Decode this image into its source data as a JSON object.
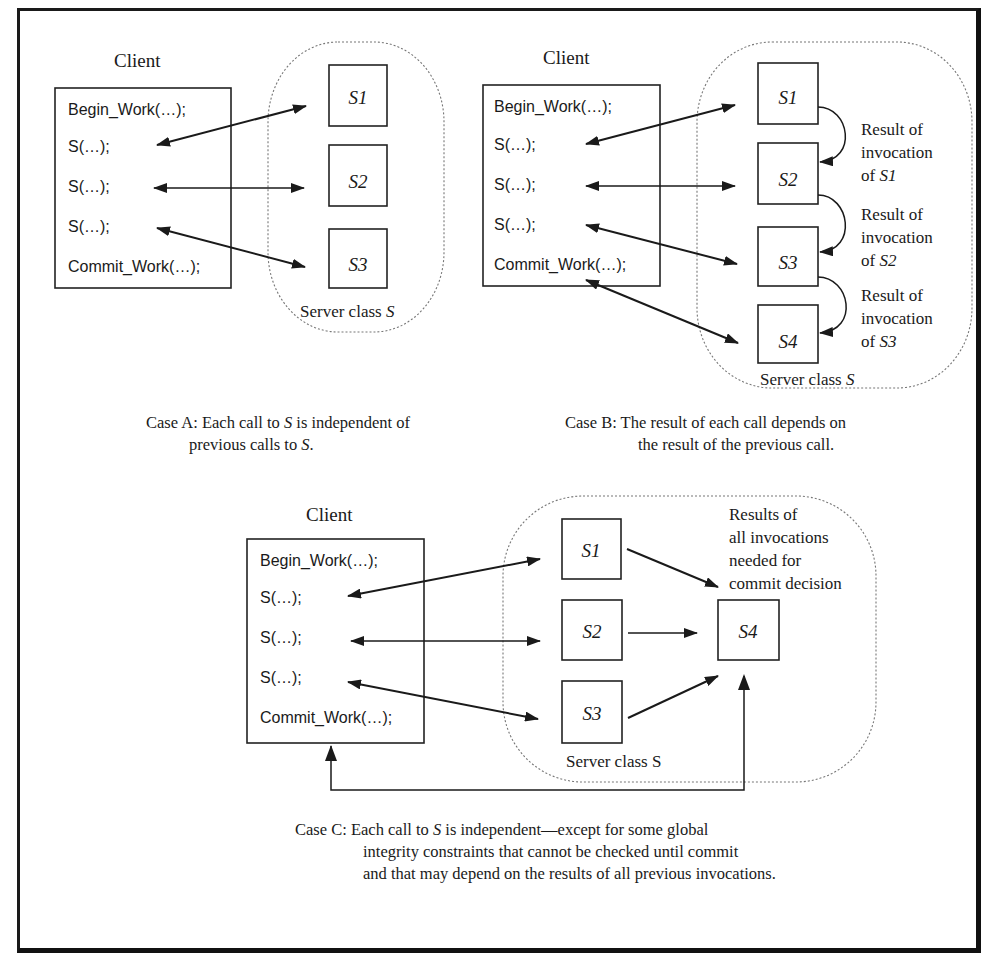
{
  "case_a": {
    "client_title": "Client",
    "client_lines": [
      "Begin_Work(…);",
      "S(…);",
      "S(…);",
      "S(…);",
      "Commit_Work(…);"
    ],
    "servers": [
      "S1",
      "S2",
      "S3"
    ],
    "server_class_label": "Server class ",
    "server_class_var": "S",
    "caption_lead": "Case A: ",
    "caption_line1_a": "Each call to ",
    "caption_line1_var": "S",
    "caption_line1_b": " is independent of",
    "caption_line2_a": "previous calls to ",
    "caption_line2_var": "S",
    "caption_line2_b": "."
  },
  "case_b": {
    "client_title": "Client",
    "client_lines": [
      "Begin_Work(…);",
      "S(…);",
      "S(…);",
      "S(…);",
      "Commit_Work(…);"
    ],
    "servers": [
      "S1",
      "S2",
      "S3",
      "S4"
    ],
    "dependency_labels": [
      {
        "line1": "Result of",
        "line2": "invocation",
        "line3_a": "of ",
        "line3_var": "S1"
      },
      {
        "line1": "Result of",
        "line2": "invocation",
        "line3_a": "of ",
        "line3_var": "S2"
      },
      {
        "line1": "Result of",
        "line2": "invocation",
        "line3_a": "of ",
        "line3_var": "S3"
      }
    ],
    "server_class_label": "Server class ",
    "server_class_var": "S",
    "caption_line1": "Case B: The result of each call depends on",
    "caption_line2": "the result of the previous call."
  },
  "case_c": {
    "client_title": "Client",
    "client_lines": [
      "Begin_Work(…);",
      "S(…);",
      "S(…);",
      "S(…);",
      "Commit_Work(…);"
    ],
    "servers": [
      "S1",
      "S2",
      "S3"
    ],
    "aggregator": "S4",
    "aggregator_note": [
      "Results of",
      "all invocations",
      "needed for",
      "commit decision"
    ],
    "server_class_label": "Server class S",
    "caption_line1_a": "Case C: Each call to ",
    "caption_line1_var": "S",
    "caption_line1_b": " is independent—except for some global",
    "caption_line2": "integrity constraints that cannot be checked until commit",
    "caption_line3": "and that may depend on the results of all previous invocations."
  }
}
